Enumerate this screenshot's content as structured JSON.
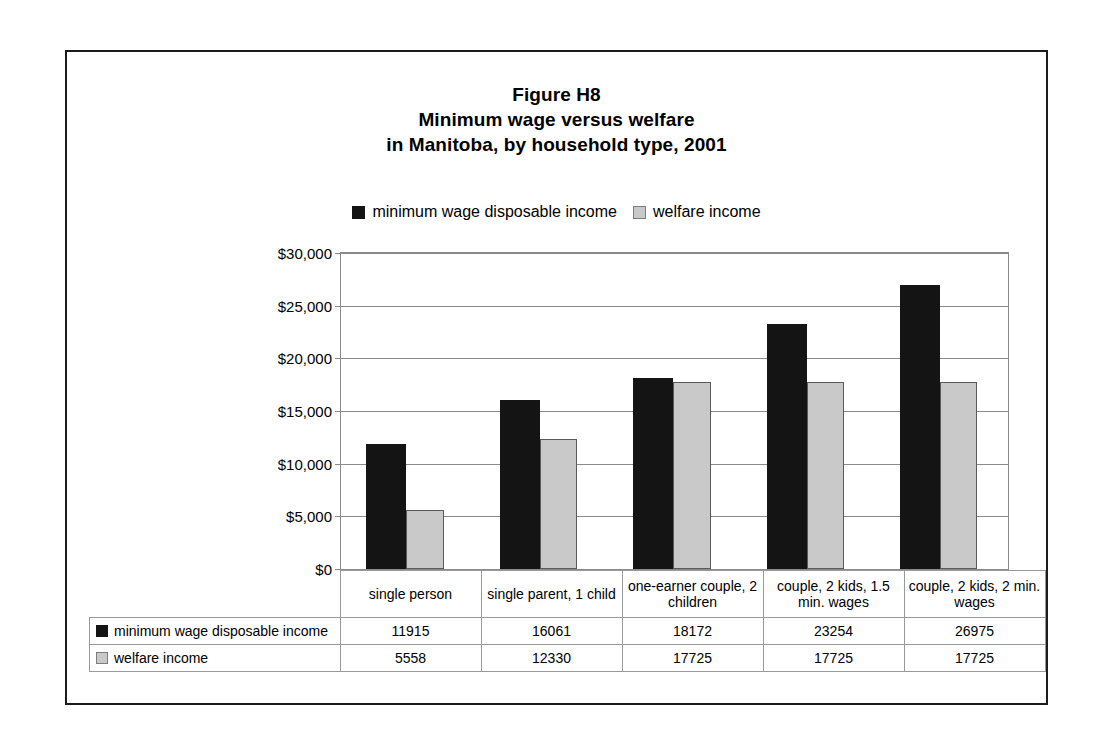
{
  "figure": {
    "title_lines": [
      "Figure H8",
      "Minimum wage versus welfare",
      "in Manitoba, by household type, 2001"
    ]
  },
  "chart_data": {
    "type": "bar",
    "title": "Figure H8 Minimum wage versus welfare in Manitoba, by household type, 2001",
    "xlabel": "",
    "ylabel": "",
    "ylim": [
      0,
      30000
    ],
    "ytick_labels": [
      "$30,000",
      "$25,000",
      "$20,000",
      "$15,000",
      "$10,000",
      "$5,000",
      "$0"
    ],
    "ytick_values": [
      30000,
      25000,
      20000,
      15000,
      10000,
      5000,
      0
    ],
    "grid": true,
    "legend_position": "top-center",
    "categories": [
      "single person",
      "single parent, 1 child",
      "one-earner couple, 2 children",
      "couple, 2 kids, 1.5 min. wages",
      "couple, 2 kids, 2 min. wages"
    ],
    "series": [
      {
        "name": "minimum wage disposable income",
        "color": "#141414",
        "values": [
          11915,
          16061,
          18172,
          23254,
          26975
        ]
      },
      {
        "name": "welfare income",
        "color": "#c9c9c9",
        "values": [
          5558,
          12330,
          17725,
          17725,
          17725
        ]
      }
    ]
  }
}
